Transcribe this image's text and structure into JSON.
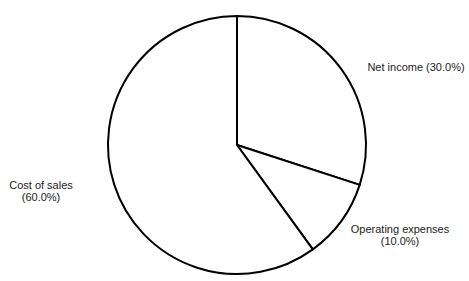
{
  "chart_data": {
    "type": "pie",
    "title": "",
    "start_angle": "12 o'clock",
    "direction": "clockwise",
    "categories": [
      "Net income",
      "Operating expenses",
      "Cost of sales"
    ],
    "values": [
      30.0,
      10.0,
      60.0
    ],
    "unit": "%",
    "labels": [
      {
        "name": "Net income",
        "value_text": "(30.0%)",
        "line1": "Net income (30.0%)",
        "line2": ""
      },
      {
        "name": "Operating expenses",
        "value_text": "(10.0%)",
        "line1": "Operating expenses",
        "line2": "(10.0%)"
      },
      {
        "name": "Cost of sales",
        "value_text": "(60.0%)",
        "line1": "Cost of sales",
        "line2": "(60.0%)"
      }
    ],
    "legend": "none",
    "fill_color": "#ffffff",
    "stroke_color": "#000000"
  }
}
